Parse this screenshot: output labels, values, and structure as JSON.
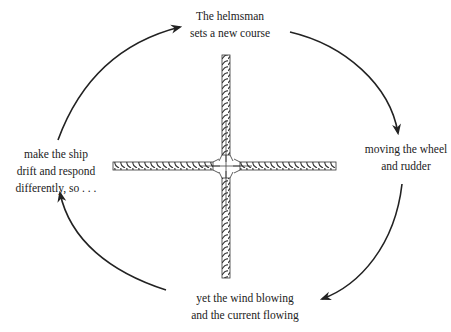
{
  "diagram": {
    "type": "cycle",
    "stroke_color": "#222222",
    "nodes": [
      {
        "id": "top",
        "lines": [
          "The helmsman",
          "sets a new course"
        ]
      },
      {
        "id": "right",
        "lines": [
          "moving the wheel",
          "and rudder"
        ]
      },
      {
        "id": "bottom",
        "lines": [
          "yet the wind blowing",
          "and the current flowing"
        ]
      },
      {
        "id": "left",
        "lines": [
          "make the ship",
          "drift and respond",
          "differently, so . . ."
        ]
      }
    ],
    "edges": [
      {
        "from": "top",
        "to": "right"
      },
      {
        "from": "right",
        "to": "bottom"
      },
      {
        "from": "bottom",
        "to": "left"
      },
      {
        "from": "left",
        "to": "top"
      }
    ],
    "center_illustration": "four-ropes-cross"
  }
}
